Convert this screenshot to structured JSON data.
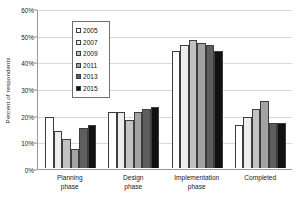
{
  "chart_data": {
    "type": "bar",
    "title": "",
    "subtitle": "",
    "xlabel": "",
    "ylabel": "Percent of respondents",
    "categories": [
      "Planning phase",
      "Design phase",
      "Implementation phase",
      "Completed"
    ],
    "category_lines": [
      [
        "Planning",
        "phase"
      ],
      [
        "Design",
        "phase"
      ],
      [
        "Implementation",
        "phase"
      ],
      [
        "Completed",
        ""
      ]
    ],
    "series": [
      {
        "name": "2005",
        "color": "#ffffff",
        "values": [
          19,
          21,
          44,
          16
        ]
      },
      {
        "name": "2007",
        "color": "#ededed",
        "values": [
          14,
          21,
          46,
          19
        ]
      },
      {
        "name": "2009",
        "color": "#c2c2c2",
        "values": [
          11,
          18,
          48,
          22
        ]
      },
      {
        "name": "2011",
        "color": "#a3a3a3",
        "values": [
          7,
          21,
          47,
          25
        ]
      },
      {
        "name": "2013",
        "color": "#5e5e5e",
        "values": [
          15,
          22,
          46,
          17
        ]
      },
      {
        "name": "2015",
        "color": "#111111",
        "values": [
          16,
          23,
          44,
          17
        ]
      }
    ],
    "ylim": [
      0,
      60
    ],
    "ytick_values": [
      0,
      10,
      20,
      30,
      40,
      50,
      60
    ],
    "ytick_labels": [
      "0%",
      "10%",
      "20%",
      "30%",
      "40%",
      "50%",
      "60%"
    ],
    "grid": true,
    "legend_position": "upper-left-inside",
    "value_suffix": "%"
  },
  "legend": {
    "items": [
      {
        "label": "2005",
        "color": "#ffffff"
      },
      {
        "label": "2007",
        "color": "#ededed"
      },
      {
        "label": "2009",
        "color": "#c2c2c2"
      },
      {
        "label": "2011",
        "color": "#a3a3a3"
      },
      {
        "label": "2013",
        "color": "#5e5e5e"
      },
      {
        "label": "2015",
        "color": "#111111"
      }
    ]
  }
}
